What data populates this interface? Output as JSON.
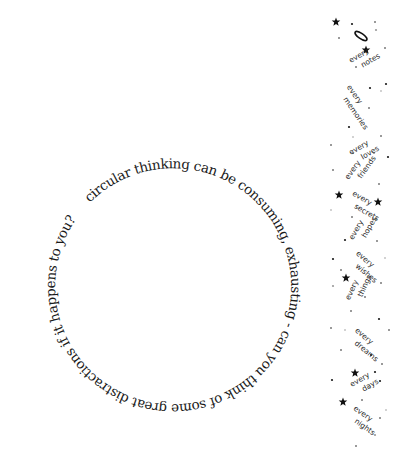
{
  "circle": {
    "text": "circular thinking can be consuming, exhausting - can you think of some great distractions if it happens to you?",
    "center": [
      147,
      306
    ],
    "radius": 118,
    "start_angle_deg": -119
  },
  "strip": {
    "words": [
      {
        "top": "every",
        "bottom": "notes",
        "x": 356,
        "y": 60,
        "angle": -30
      },
      {
        "top": "every",
        "bottom": "memories",
        "x": 350,
        "y": 92,
        "angle": 55
      },
      {
        "top": "every",
        "bottom": "loves",
        "x": 356,
        "y": 152,
        "angle": -30
      },
      {
        "top": "every",
        "bottom": "friends",
        "x": 352,
        "y": 175,
        "angle": -55
      },
      {
        "top": "every",
        "bottom": "secrets",
        "x": 357,
        "y": 198,
        "angle": 30
      },
      {
        "top": "every",
        "bottom": "hopes",
        "x": 356,
        "y": 235,
        "angle": -60
      },
      {
        "top": "every",
        "bottom": "wishes",
        "x": 360,
        "y": 258,
        "angle": 40
      },
      {
        "top": "every",
        "bottom": "things",
        "x": 352,
        "y": 295,
        "angle": -65
      },
      {
        "top": "every",
        "bottom": "dreams",
        "x": 359,
        "y": 335,
        "angle": 40
      },
      {
        "top": "every",
        "bottom": "days",
        "x": 357,
        "y": 384,
        "angle": -30
      },
      {
        "top": "every",
        "bottom": "nights",
        "x": 358,
        "y": 413,
        "angle": 35
      }
    ],
    "stars": [
      {
        "x": 336,
        "y": 22,
        "r": 4.5
      },
      {
        "x": 366,
        "y": 50,
        "r": 4.5
      },
      {
        "x": 339,
        "y": 195,
        "r": 4.5
      },
      {
        "x": 378,
        "y": 202,
        "r": 4.5
      },
      {
        "x": 346,
        "y": 278,
        "r": 4.5
      },
      {
        "x": 355,
        "y": 373,
        "r": 4.5
      },
      {
        "x": 343,
        "y": 402,
        "r": 4.5
      }
    ],
    "halo": {
      "x": 361,
      "y": 36
    },
    "dots": [
      [
        352,
        24
      ],
      [
        375,
        22
      ],
      [
        339,
        38
      ],
      [
        376,
        30
      ],
      [
        385,
        48
      ],
      [
        356,
        67
      ],
      [
        370,
        88
      ],
      [
        381,
        91
      ],
      [
        369,
        108
      ],
      [
        349,
        127
      ],
      [
        381,
        136
      ],
      [
        353,
        137
      ],
      [
        386,
        84
      ],
      [
        331,
        145
      ],
      [
        353,
        153
      ],
      [
        374,
        153
      ],
      [
        333,
        170
      ],
      [
        379,
        184
      ],
      [
        388,
        157
      ],
      [
        331,
        210
      ],
      [
        352,
        217
      ],
      [
        345,
        240
      ],
      [
        377,
        241
      ],
      [
        385,
        258
      ],
      [
        333,
        259
      ],
      [
        341,
        270
      ],
      [
        381,
        283
      ],
      [
        333,
        286
      ],
      [
        365,
        297
      ],
      [
        351,
        311
      ],
      [
        379,
        319
      ],
      [
        345,
        330
      ],
      [
        389,
        330
      ],
      [
        371,
        355
      ],
      [
        382,
        364
      ],
      [
        370,
        388
      ],
      [
        380,
        381
      ],
      [
        362,
        400
      ],
      [
        380,
        418
      ],
      [
        375,
        435
      ],
      [
        356,
        446
      ],
      [
        331,
        328
      ],
      [
        332,
        380
      ],
      [
        386,
        410
      ],
      [
        341,
        350
      ],
      [
        375,
        372
      ]
    ]
  }
}
